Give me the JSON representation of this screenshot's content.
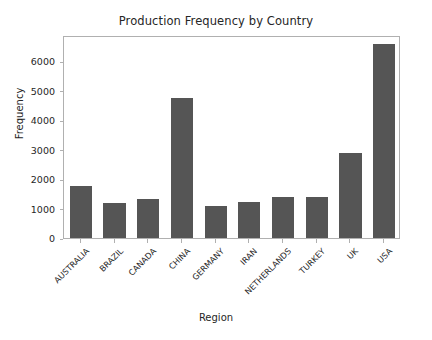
{
  "chart_data": {
    "type": "bar",
    "title": "Production Frequency by Country",
    "xlabel": "Region",
    "ylabel": "Frequency",
    "categories": [
      "AUSTRALIA",
      "BRAZIL",
      "CANADA",
      "CHINA",
      "GERMANY",
      "IRAN",
      "NETHERLANDS",
      "TURKEY",
      "UK",
      "USA"
    ],
    "values": [
      1780,
      1200,
      1330,
      4760,
      1100,
      1240,
      1400,
      1400,
      2900,
      6600
    ],
    "ylim": [
      0,
      6900
    ],
    "yticks": [
      0,
      1000,
      2000,
      3000,
      4000,
      5000,
      6000
    ],
    "ytick_labels": [
      "0",
      "1000",
      "2000",
      "3000",
      "4000",
      "5000",
      "6000"
    ],
    "grid": false,
    "legend": null,
    "bar_color": "#555555",
    "axes_color": "#b0b0b0",
    "text_color": "#262626",
    "background": "#ffffff"
  }
}
